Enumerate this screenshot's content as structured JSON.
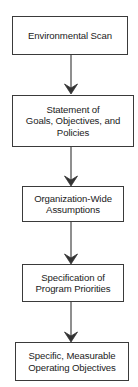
{
  "diagram": {
    "type": "flowchart",
    "direction": "top-to-bottom",
    "colors": {
      "border": "#3a3a3a",
      "arrow": "#333333",
      "background": "#ffffff",
      "text": "#222222"
    },
    "nodes": [
      {
        "id": "environmental-scan",
        "lines": [
          "Environmental Scan"
        ]
      },
      {
        "id": "statement-of-goals",
        "lines": [
          "Statement of",
          "Goals, Objectives, and",
          "Policies"
        ]
      },
      {
        "id": "organization-wide-assumptions",
        "lines": [
          "Organization-Wide",
          "Assumptions"
        ]
      },
      {
        "id": "specification-of-priorities",
        "lines": [
          "Specification of",
          "Program Priorities"
        ]
      },
      {
        "id": "operating-objectives",
        "lines": [
          "Specific, Measurable",
          "Operating Objectives"
        ]
      }
    ],
    "edges": [
      {
        "from": "environmental-scan",
        "to": "statement-of-goals"
      },
      {
        "from": "statement-of-goals",
        "to": "organization-wide-assumptions"
      },
      {
        "from": "organization-wide-assumptions",
        "to": "specification-of-priorities"
      },
      {
        "from": "specification-of-priorities",
        "to": "operating-objectives"
      }
    ]
  }
}
